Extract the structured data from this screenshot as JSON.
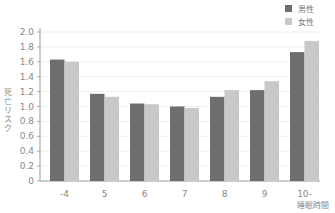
{
  "chart_data": {
    "type": "bar",
    "title": "",
    "xlabel": "睡眠時間",
    "ylabel": "死亡リスク",
    "categories": [
      "-4",
      "5",
      "6",
      "7",
      "8",
      "9",
      "10-"
    ],
    "series": [
      {
        "name": "男性",
        "color": "#6e6e6e",
        "values": [
          1.63,
          1.17,
          1.04,
          1.0,
          1.13,
          1.22,
          1.73
        ]
      },
      {
        "name": "女性",
        "color": "#c8c8c8",
        "values": [
          1.6,
          1.13,
          1.03,
          0.98,
          1.22,
          1.34,
          1.88
        ]
      }
    ],
    "ylim": [
      0,
      2.0
    ],
    "yticks": [
      "0",
      "0.2",
      "0.4",
      "0.6",
      "0.8",
      "1.0",
      "1.2",
      "1.4",
      "1.6",
      "1.8",
      "2.0"
    ],
    "grid": true,
    "legend_position": "top-right"
  },
  "legend": {
    "male": "男性",
    "female": "女性"
  }
}
